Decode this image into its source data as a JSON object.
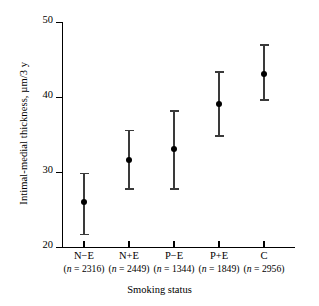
{
  "chart_data": {
    "type": "scatter",
    "title": "",
    "xlabel": "Smoking status",
    "ylabel": "Intimal-medial thickness, µm/3 y",
    "ylim": [
      20,
      50
    ],
    "yticks": [
      20,
      30,
      40,
      50
    ],
    "ytick_labels": [
      "20",
      "30",
      "40",
      "50"
    ],
    "grid": false,
    "legend": null,
    "categories": [
      "N−E",
      "N+E",
      "P−E",
      "P+E",
      "C"
    ],
    "group_sizes": [
      2316,
      2449,
      1344,
      1849,
      2956
    ],
    "group_size_labels": [
      "(n = 2316)",
      "(n = 2449)",
      "(n = 1344)",
      "(n = 1849)",
      "(n = 2956)"
    ],
    "n_prefix": "n",
    "n_suffix_open": "(",
    "n_eq": " = ",
    "n_suffix_close": ")",
    "values": [
      26.0,
      31.6,
      33.1,
      39.1,
      43.1
    ],
    "error_low": [
      21.5,
      27.6,
      27.6,
      34.7,
      39.5
    ],
    "error_high": [
      29.9,
      35.6,
      38.2,
      43.4,
      47.0
    ],
    "series": [
      {
        "name": "Intimal-medial thickness",
        "points": [
          {
            "category": "N−E",
            "value": 26.0,
            "low": 21.5,
            "high": 29.9,
            "n": 2316
          },
          {
            "category": "N+E",
            "value": 31.6,
            "low": 27.6,
            "high": 35.6,
            "n": 2449
          },
          {
            "category": "P−E",
            "value": 33.1,
            "low": 27.6,
            "high": 38.2,
            "n": 1344
          },
          {
            "category": "P+E",
            "value": 39.1,
            "low": 34.7,
            "high": 43.4,
            "n": 1849
          },
          {
            "category": "C",
            "value": 43.1,
            "low": 39.5,
            "high": 47.0,
            "n": 2956
          }
        ]
      }
    ],
    "colors": {
      "marker": "#000000",
      "errorbar": "#3a3a3a",
      "axis": "#000000",
      "background": "#ffffff"
    }
  }
}
